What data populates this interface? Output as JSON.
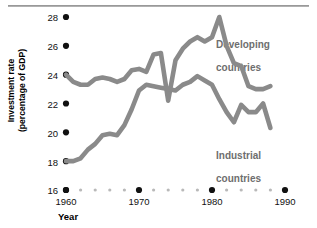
{
  "chart_data": {
    "type": "line",
    "title": "",
    "xlabel": "Year",
    "ylabel": "Investment rate\n(percentage of GDP)",
    "ylabel_line1": "Investment rate",
    "ylabel_line2": "(percentage of GDP)",
    "xlim": [
      1960,
      1990
    ],
    "ylim": [
      16,
      28
    ],
    "yticks": [
      16,
      18,
      20,
      22,
      24,
      26,
      28
    ],
    "ytick_labels": [
      "16",
      "18",
      "20",
      "22",
      "24",
      "26",
      "28"
    ],
    "xticks": [
      1960,
      1970,
      1980,
      1990
    ],
    "xtick_labels": [
      "1960",
      "1970",
      "1980",
      "1990"
    ],
    "x_minor_ticks": [
      1962,
      1964,
      1966,
      1968,
      1972,
      1974,
      1976,
      1978,
      1982,
      1984,
      1986,
      1988
    ],
    "grid": false,
    "legend_position": "inline-annotations",
    "line_color": "#8a8a8a",
    "major_tick_color": "#111111",
    "minor_tick_color": "#b9b9b9",
    "series": [
      {
        "name": "Developing countries",
        "label_line1": "Developing",
        "label_line2": "countries",
        "x": [
          1960,
          1961,
          1962,
          1963,
          1964,
          1965,
          1966,
          1967,
          1968,
          1969,
          1970,
          1971,
          1972,
          1973,
          1974,
          1975,
          1976,
          1977,
          1978,
          1979,
          1980,
          1981,
          1982,
          1983,
          1984,
          1985,
          1986,
          1987,
          1988
        ],
        "values": [
          24.0,
          23.5,
          23.3,
          23.3,
          23.7,
          23.8,
          23.7,
          23.5,
          23.7,
          24.3,
          24.4,
          24.2,
          25.4,
          25.5,
          22.2,
          25.0,
          25.8,
          26.3,
          26.6,
          26.3,
          26.6,
          28.0,
          26.0,
          24.8,
          24.6,
          23.2,
          23.0,
          23.0,
          23.2
        ]
      },
      {
        "name": "Industrial countries",
        "label_line1": "Industrial",
        "label_line2": "countries",
        "x": [
          1960,
          1961,
          1962,
          1963,
          1964,
          1965,
          1966,
          1967,
          1968,
          1969,
          1970,
          1971,
          1972,
          1973,
          1974,
          1975,
          1976,
          1977,
          1978,
          1979,
          1980,
          1981,
          1982,
          1983,
          1984,
          1985,
          1986,
          1987,
          1988
        ],
        "values": [
          18.0,
          18.0,
          18.2,
          18.8,
          19.2,
          19.8,
          19.9,
          19.8,
          20.5,
          21.6,
          22.9,
          23.3,
          23.2,
          23.1,
          23.0,
          22.9,
          23.3,
          23.5,
          23.9,
          23.6,
          23.3,
          22.3,
          21.4,
          20.7,
          21.9,
          21.4,
          21.4,
          22.0,
          20.3
        ]
      }
    ]
  },
  "axes_geometry": {
    "plot_left_px": 66,
    "plot_right_px": 285,
    "y_top_px": 17,
    "y_bottom_px": 190
  }
}
